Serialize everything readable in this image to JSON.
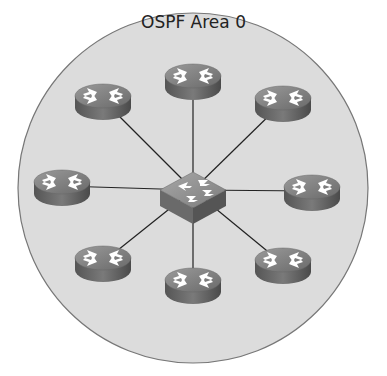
{
  "area": {
    "label": "OSPF Area 0",
    "fill": "#dcdcdc",
    "stroke": "#777777"
  },
  "hub": {
    "name": "switch",
    "x": 193,
    "y": 190
  },
  "routers": [
    {
      "name": "router-top",
      "x": 193,
      "y": 80
    },
    {
      "name": "router-top-left",
      "x": 103,
      "y": 100
    },
    {
      "name": "router-top-right",
      "x": 283,
      "y": 102
    },
    {
      "name": "router-left",
      "x": 62,
      "y": 186
    },
    {
      "name": "router-right",
      "x": 312,
      "y": 191
    },
    {
      "name": "router-bottom-left",
      "x": 103,
      "y": 262
    },
    {
      "name": "router-bottom-right",
      "x": 283,
      "y": 264
    },
    {
      "name": "router-bottom",
      "x": 193,
      "y": 284
    }
  ]
}
